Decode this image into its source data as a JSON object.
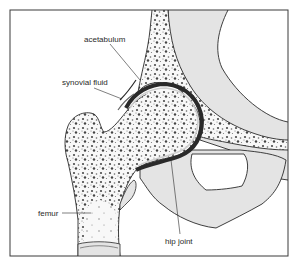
{
  "figure": {
    "colors": {
      "outline": "#2a2a2a",
      "cartilage_gray": "#e4e4e4",
      "bone_fill": "#f8f8f8",
      "spongy_dots": "#555555",
      "joint_dark": "#3a3a3a",
      "background": "#ffffff"
    },
    "labels": {
      "acetabulum": "acetabulum",
      "synovial_fluid": "synovial fluid",
      "femur": "femur",
      "hip_joint": "hip joint"
    }
  }
}
